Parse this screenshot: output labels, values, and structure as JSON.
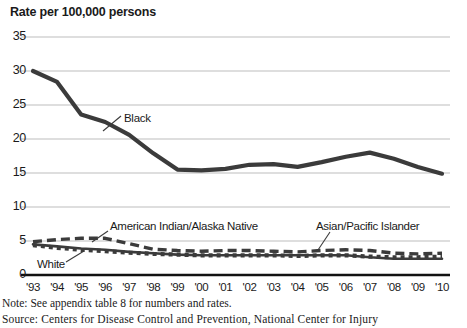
{
  "chart": {
    "title": "Rate per 100,000 persons",
    "note": "Note: See appendix table 8 for numbers and rates.",
    "source": "Source: Centers for Disease Control and Prevention, National Center for Injury",
    "labels": {
      "black": "Black",
      "white": "White",
      "aian": "American Indian/Alaska Native",
      "api": "Asian/Pacific Islander"
    },
    "colors": {
      "line": "#3b3b3b",
      "grid": "#bdbdbd",
      "axis": "#111111",
      "text": "#1a1a1a"
    }
  },
  "chart_data": {
    "type": "line",
    "title": "Rate per 100,000 persons",
    "xlabel": "",
    "ylabel": "Rate per 100,000 persons",
    "ylim": [
      0,
      35
    ],
    "yticks": [
      0,
      5,
      10,
      15,
      20,
      25,
      30,
      35
    ],
    "grid": true,
    "legend": "inline-annotations",
    "categories": [
      "'93",
      "'94",
      "'95",
      "'96",
      "'97",
      "'98",
      "'99",
      "'00",
      "'01",
      "'02",
      "'03",
      "'04",
      "'05",
      "'06",
      "'07",
      "'08",
      "'09",
      "'10"
    ],
    "series": [
      {
        "name": "Black",
        "style": "solid-thick",
        "values": [
          30.0,
          28.4,
          23.6,
          22.5,
          20.6,
          17.9,
          15.5,
          15.4,
          15.6,
          16.2,
          16.3,
          15.9,
          16.6,
          17.4,
          18.0,
          17.1,
          15.9,
          14.9
        ]
      },
      {
        "name": "American Indian/Alaska Native",
        "style": "long-dash",
        "values": [
          4.9,
          5.2,
          5.4,
          5.4,
          4.6,
          3.8,
          3.6,
          3.5,
          3.6,
          3.6,
          3.5,
          3.4,
          3.6,
          3.7,
          3.6,
          3.2,
          3.1,
          3.2
        ]
      },
      {
        "name": "Asian/Pacific Islander",
        "style": "square-dot",
        "values": [
          4.4,
          4.0,
          3.7,
          3.5,
          3.3,
          3.1,
          3.0,
          2.9,
          2.9,
          2.9,
          2.9,
          2.8,
          2.9,
          2.9,
          2.7,
          2.6,
          2.6,
          2.7
        ]
      },
      {
        "name": "White",
        "style": "solid",
        "values": [
          4.5,
          4.2,
          3.9,
          3.7,
          3.4,
          3.2,
          3.0,
          2.9,
          2.9,
          2.9,
          2.9,
          2.9,
          2.9,
          2.9,
          2.6,
          2.4,
          2.4,
          2.4
        ]
      }
    ]
  }
}
